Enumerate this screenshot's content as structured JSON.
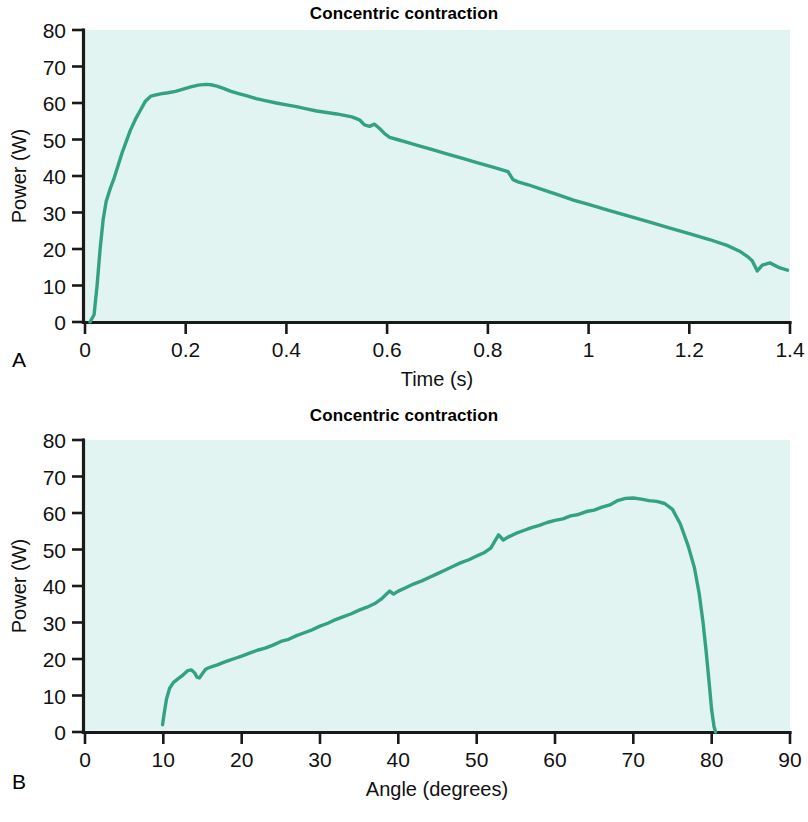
{
  "figure": {
    "panel_a_letter": "A",
    "panel_b_letter": "B"
  },
  "chart_data": [
    {
      "panel": "A",
      "type": "line",
      "title": "Concentric contraction",
      "xlabel": "Time (s)",
      "ylabel": "Power (W)",
      "xlim": [
        0,
        1.4
      ],
      "ylim": [
        0,
        80
      ],
      "xticks": [
        0,
        0.2,
        0.4,
        0.6,
        0.8,
        1,
        1.2,
        1.4
      ],
      "xticklabels": [
        "0",
        "0.2",
        "0.4",
        "0.6",
        "0.8",
        "1",
        "1.2",
        "1.4"
      ],
      "yticks": [
        0,
        10,
        20,
        30,
        40,
        50,
        60,
        70,
        80
      ],
      "yticklabels": [
        "0",
        "10",
        "20",
        "30",
        "40",
        "50",
        "60",
        "70",
        "80"
      ],
      "grid": false,
      "legend": "none",
      "series_color": "#33a282",
      "plot_background": "#e1f4f1",
      "series": [
        {
          "name": "Power",
          "x": [
            0.01,
            0.018,
            0.024,
            0.03,
            0.036,
            0.042,
            0.05,
            0.058,
            0.066,
            0.074,
            0.082,
            0.09,
            0.1,
            0.11,
            0.12,
            0.13,
            0.14,
            0.15,
            0.165,
            0.18,
            0.195,
            0.21,
            0.225,
            0.24,
            0.25,
            0.262,
            0.275,
            0.29,
            0.305,
            0.32,
            0.34,
            0.36,
            0.38,
            0.4,
            0.42,
            0.44,
            0.46,
            0.48,
            0.5,
            0.515,
            0.53,
            0.545,
            0.555,
            0.565,
            0.575,
            0.585,
            0.595,
            0.605,
            0.62,
            0.64,
            0.66,
            0.69,
            0.72,
            0.75,
            0.78,
            0.81,
            0.83,
            0.84,
            0.85,
            0.86,
            0.88,
            0.91,
            0.94,
            0.97,
            1.0,
            1.04,
            1.08,
            1.12,
            1.16,
            1.2,
            1.24,
            1.275,
            1.3,
            1.315,
            1.325,
            1.335,
            1.345,
            1.36,
            1.38,
            1.395
          ],
          "y": [
            0.0,
            2.0,
            10.0,
            20.0,
            28.0,
            33.0,
            36.5,
            39.5,
            43.0,
            46.5,
            49.5,
            52.5,
            55.5,
            58.0,
            60.5,
            61.8,
            62.2,
            62.5,
            62.8,
            63.2,
            63.8,
            64.4,
            64.9,
            65.1,
            65.0,
            64.6,
            64.0,
            63.2,
            62.6,
            62.0,
            61.2,
            60.6,
            60.0,
            59.5,
            59.0,
            58.4,
            57.8,
            57.4,
            57.0,
            56.6,
            56.2,
            55.4,
            54.0,
            53.6,
            54.2,
            53.0,
            51.6,
            50.6,
            50.0,
            49.2,
            48.4,
            47.2,
            46.0,
            44.8,
            43.6,
            42.4,
            41.6,
            41.2,
            39.0,
            38.4,
            37.6,
            36.2,
            34.8,
            33.4,
            32.2,
            30.6,
            29.0,
            27.4,
            25.8,
            24.2,
            22.6,
            21.0,
            19.4,
            18.0,
            16.8,
            14.0,
            15.6,
            16.2,
            14.8,
            14.2
          ]
        }
      ]
    },
    {
      "panel": "B",
      "type": "line",
      "title": "Concentric contraction",
      "xlabel": "Angle (degrees)",
      "ylabel": "Power (W)",
      "xlim": [
        0,
        90
      ],
      "ylim": [
        0,
        80
      ],
      "xticks": [
        0,
        10,
        20,
        30,
        40,
        50,
        60,
        70,
        80,
        90
      ],
      "xticklabels": [
        "0",
        "10",
        "20",
        "30",
        "40",
        "50",
        "60",
        "70",
        "80",
        "90"
      ],
      "yticks": [
        0,
        10,
        20,
        30,
        40,
        50,
        60,
        70,
        80
      ],
      "yticklabels": [
        "0",
        "10",
        "20",
        "30",
        "40",
        "50",
        "60",
        "70",
        "80"
      ],
      "grid": false,
      "legend": "none",
      "series_color": "#33a282",
      "plot_background": "#e1f4f1",
      "series": [
        {
          "name": "Power",
          "x": [
            9.9,
            10.1,
            10.4,
            10.8,
            11.3,
            11.9,
            12.5,
            13.1,
            13.6,
            14.0,
            14.3,
            14.6,
            15.0,
            15.4,
            15.8,
            16.3,
            16.9,
            17.6,
            18.4,
            19.2,
            20.0,
            21.0,
            22.0,
            23.0,
            24.0,
            25.0,
            26.0,
            27.0,
            28.0,
            29.0,
            30.0,
            31.0,
            32.0,
            33.0,
            34.0,
            35.0,
            36.0,
            37.0,
            37.8,
            38.4,
            38.9,
            39.4,
            40.0,
            41.0,
            42.0,
            43.0,
            44.0,
            45.0,
            46.0,
            47.0,
            48.0,
            49.0,
            50.0,
            51.0,
            51.8,
            52.3,
            52.8,
            53.4,
            54.0,
            55.0,
            56.0,
            57.0,
            58.0,
            59.0,
            60.0,
            61.0,
            62.0,
            63.0,
            64.0,
            65.0,
            66.0,
            67.0,
            68.0,
            69.0,
            70.0,
            71.0,
            72.0,
            73.0,
            74.0,
            75.0,
            76.0,
            77.0,
            77.8,
            78.4,
            78.9,
            79.3,
            79.7,
            80.0,
            80.3,
            80.5
          ],
          "y": [
            2.0,
            5.0,
            9.0,
            12.0,
            13.6,
            14.6,
            15.6,
            16.8,
            17.0,
            16.2,
            15.0,
            14.8,
            16.0,
            17.2,
            17.6,
            18.0,
            18.4,
            19.0,
            19.6,
            20.2,
            20.8,
            21.6,
            22.4,
            23.0,
            23.8,
            24.8,
            25.4,
            26.4,
            27.2,
            28.0,
            29.0,
            29.8,
            30.8,
            31.6,
            32.4,
            33.4,
            34.2,
            35.2,
            36.4,
            37.6,
            38.6,
            37.8,
            38.6,
            39.6,
            40.6,
            41.4,
            42.4,
            43.4,
            44.4,
            45.4,
            46.4,
            47.2,
            48.2,
            49.2,
            50.4,
            52.2,
            54.0,
            52.6,
            53.4,
            54.4,
            55.2,
            56.0,
            56.6,
            57.4,
            58.0,
            58.4,
            59.2,
            59.6,
            60.4,
            60.8,
            61.6,
            62.2,
            63.4,
            64.0,
            64.1,
            63.8,
            63.4,
            63.2,
            62.6,
            61.0,
            57.0,
            51.0,
            45.0,
            38.0,
            30.0,
            22.0,
            13.0,
            6.0,
            1.5,
            0.0
          ]
        }
      ]
    }
  ]
}
